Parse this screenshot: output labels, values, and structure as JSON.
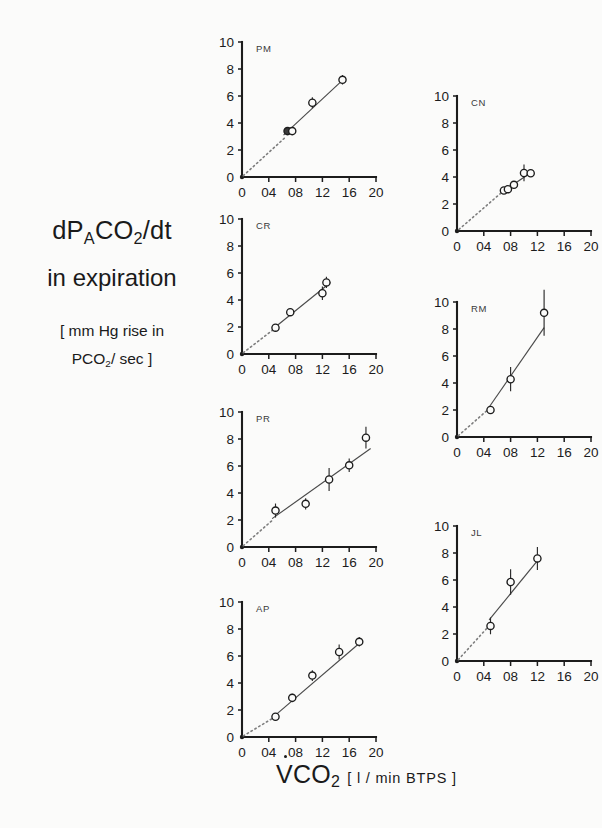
{
  "figure": {
    "background": "#fbfbfa",
    "ink": "#1c1c1c"
  },
  "axis_titles": {
    "y_line1_a": "dP",
    "y_line1_b": "A",
    "y_line1_c": "CO",
    "y_line1_d": "2",
    "y_line1_e": "/dt",
    "y_line2": "in expiration",
    "y_line3": "[ mm Hg  rise in",
    "y_line4_a": "PCO",
    "y_line4_b": "2",
    "y_line4_c": "/ sec ]",
    "x_main_a": "V",
    "x_main_b": "CO",
    "x_main_c": "2",
    "x_units": "[ l / min  BTPS ]"
  },
  "axes": {
    "x_ticklabels": [
      "0",
      "04",
      "08",
      "12",
      "16",
      "20"
    ],
    "x_tickvalues": [
      0,
      0.4,
      0.8,
      1.2,
      1.6,
      2.0
    ],
    "y_ticklabels": [
      "0",
      "2",
      "4",
      "6",
      "8",
      "10"
    ],
    "y_tickvalues": [
      0,
      2,
      4,
      6,
      8,
      10
    ],
    "xlim": [
      0,
      2.0
    ],
    "ylim": [
      0,
      10
    ]
  },
  "chart_data": {
    "type": "scatter",
    "title": "",
    "xlabel": "VCO2 [ l / min BTPS ]",
    "ylabel": "dPACO2/dt in expiration [ mm Hg rise in PCO2 / sec ]",
    "xlim": [
      0,
      2.0
    ],
    "ylim": [
      0,
      10
    ],
    "grid": false,
    "legend": "none",
    "panel_layout": "2 columns x staggered rows, 7 subject panels",
    "panels": [
      {
        "subject": "PM",
        "x": [
          0.68,
          0.75,
          1.05,
          1.5
        ],
        "y": [
          3.4,
          3.4,
          5.5,
          7.2
        ],
        "yerr": [
          0.18,
          0.18,
          0.4,
          0.35
        ],
        "markers": [
          "filled",
          "open",
          "open",
          "open"
        ],
        "fit_solid": {
          "x0": 0.62,
          "y0": 3.1,
          "x1": 1.55,
          "y1": 7.4
        },
        "fit_dotted": {
          "x0": 0.02,
          "y0": 0.1,
          "x1": 0.66,
          "y1": 3.0
        }
      },
      {
        "subject": "CN",
        "x": [
          0.7,
          0.76,
          0.85,
          1.0,
          1.1
        ],
        "y": [
          3.0,
          3.1,
          3.42,
          4.3,
          4.28
        ],
        "yerr": [
          0.12,
          0.12,
          0.16,
          0.62,
          0.14
        ],
        "markers": [
          "open",
          "open",
          "open",
          "open",
          "open"
        ],
        "fit_solid": {
          "x0": 0.66,
          "y0": 2.85,
          "x1": 1.14,
          "y1": 4.45
        },
        "fit_dotted": {
          "x0": 0.03,
          "y0": 0.12,
          "x1": 0.7,
          "y1": 3.0
        }
      },
      {
        "subject": "CR",
        "x": [
          0.5,
          0.72,
          1.2,
          1.26
        ],
        "y": [
          1.95,
          3.1,
          4.5,
          5.3
        ],
        "yerr": [
          0.22,
          0.28,
          0.5,
          0.42
        ],
        "markers": [
          "open",
          "open",
          "open",
          "open"
        ],
        "fit_solid": {
          "x0": 0.46,
          "y0": 1.85,
          "x1": 1.32,
          "y1": 5.3
        },
        "fit_dotted": {
          "x0": 0.02,
          "y0": 0.1,
          "x1": 0.48,
          "y1": 1.85
        }
      },
      {
        "subject": "RM",
        "x": [
          0.5,
          0.8,
          1.3
        ],
        "y": [
          2.0,
          4.28,
          9.2
        ],
        "yerr": [
          0.28,
          0.9,
          1.7
        ],
        "markers": [
          "open",
          "open",
          "open"
        ],
        "fit_solid": {
          "x0": 0.47,
          "y0": 2.15,
          "x1": 1.3,
          "y1": 8.1
        },
        "fit_dotted": {
          "x0": 0.02,
          "y0": 0.1,
          "x1": 0.48,
          "y1": 2.1
        }
      },
      {
        "subject": "PR",
        "x": [
          0.5,
          0.95,
          1.3,
          1.6,
          1.85
        ],
        "y": [
          2.7,
          3.2,
          5.0,
          6.05,
          8.1
        ],
        "yerr": [
          0.52,
          0.42,
          0.85,
          0.5,
          0.8
        ],
        "markers": [
          "open",
          "open",
          "open",
          "open",
          "open"
        ],
        "fit_solid": {
          "x0": 0.45,
          "y0": 2.1,
          "x1": 1.92,
          "y1": 7.3
        },
        "fit_dotted": {
          "x0": 0.02,
          "y0": 0.1,
          "x1": 0.47,
          "y1": 2.05
        }
      },
      {
        "subject": "JL",
        "x": [
          0.5,
          0.8,
          1.2
        ],
        "y": [
          2.6,
          5.85,
          7.6
        ],
        "yerr": [
          0.62,
          0.95,
          0.85
        ],
        "markers": [
          "open",
          "open",
          "open"
        ],
        "fit_solid": {
          "x0": 0.48,
          "y0": 3.05,
          "x1": 1.22,
          "y1": 7.55
        },
        "fit_dotted": {
          "x0": 0.02,
          "y0": 0.1,
          "x1": 0.46,
          "y1": 2.5
        }
      },
      {
        "subject": "AP",
        "x": [
          0.5,
          0.75,
          1.05,
          1.45,
          1.75
        ],
        "y": [
          1.5,
          2.9,
          4.55,
          6.3,
          7.05
        ],
        "yerr": [
          0.22,
          0.3,
          0.4,
          0.55,
          0.35
        ],
        "markers": [
          "open",
          "open",
          "open",
          "open",
          "open"
        ],
        "fit_solid": {
          "x0": 0.46,
          "y0": 1.45,
          "x1": 1.8,
          "y1": 7.15
        },
        "fit_dotted": {
          "x0": 0.02,
          "y0": 0.08,
          "x1": 0.48,
          "y1": 1.45
        }
      }
    ]
  },
  "panel_positions": [
    {
      "subject": "PM",
      "left": 196,
      "top": 28
    },
    {
      "subject": "CN",
      "left": 411,
      "top": 82
    },
    {
      "subject": "CR",
      "left": 196,
      "top": 205
    },
    {
      "subject": "RM",
      "left": 411,
      "top": 288
    },
    {
      "subject": "PR",
      "left": 196,
      "top": 398
    },
    {
      "subject": "JL",
      "left": 411,
      "top": 512
    },
    {
      "subject": "AP",
      "left": 196,
      "top": 588
    }
  ]
}
